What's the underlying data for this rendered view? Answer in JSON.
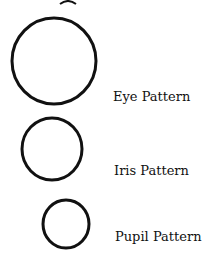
{
  "diagram": {
    "items": [
      {
        "label": "Eye Pattern",
        "shape": "circle",
        "cx": 54,
        "cy": 61,
        "r": 42
      },
      {
        "label": "Iris Pattern",
        "shape": "circle",
        "cx": 52,
        "cy": 148,
        "r": 30
      },
      {
        "label": "Pupil Pattern",
        "shape": "circle",
        "cx": 66,
        "cy": 224,
        "r": 23
      }
    ],
    "stroke_color": "#111111"
  }
}
